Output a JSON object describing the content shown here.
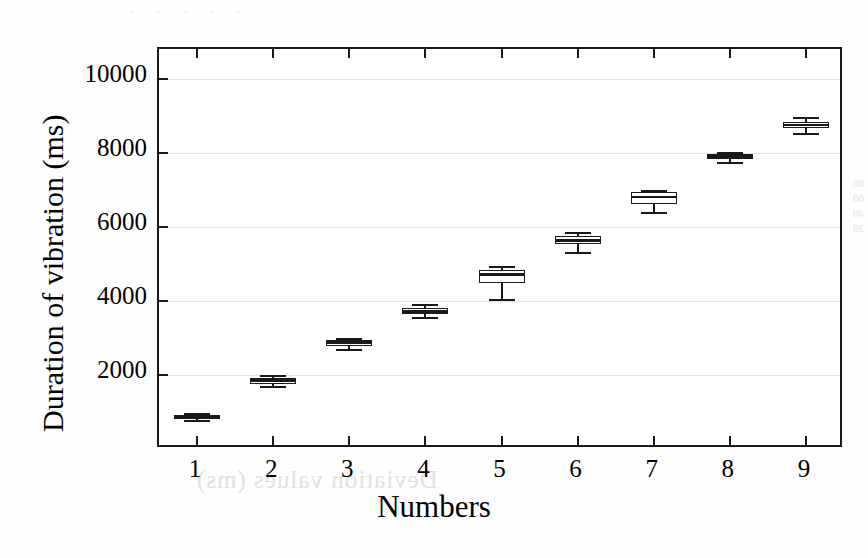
{
  "figure": {
    "background_color": "#ffffff",
    "axis_color": "#1a1a1a",
    "grid_color": "#e2e2e2",
    "box_fill": "#ffffff",
    "bleed_text_bottom": "Deviation values (ms)",
    "bleed_text_right": "80\n60\n40\n20",
    "bleed_text_top": "- - - - -"
  },
  "chart_data": {
    "type": "box",
    "title": "",
    "xlabel": "Numbers",
    "ylabel": "Duration of vibration (ms)",
    "grid": true,
    "legend": "none",
    "xlim": [
      0.5,
      9.5
    ],
    "ylim": [
      0,
      10800
    ],
    "categories": [
      "1",
      "2",
      "3",
      "4",
      "5",
      "6",
      "7",
      "8",
      "9"
    ],
    "ytick_labels": [
      "2000",
      "4000",
      "6000",
      "8000",
      "10000"
    ],
    "ytick_values": [
      2000,
      4000,
      6000,
      8000,
      10000
    ],
    "boxes": [
      {
        "category": "1",
        "whisker_low": 780,
        "q1": 820,
        "median": 880,
        "q3": 920,
        "whisker_high": 960
      },
      {
        "category": "2",
        "whisker_low": 1690,
        "q1": 1760,
        "median": 1850,
        "q3": 1930,
        "whisker_high": 1990
      },
      {
        "category": "3",
        "whisker_low": 2700,
        "q1": 2780,
        "median": 2880,
        "q3": 2930,
        "whisker_high": 2990
      },
      {
        "category": "4",
        "whisker_low": 3560,
        "q1": 3640,
        "median": 3720,
        "q3": 3800,
        "whisker_high": 3920
      },
      {
        "category": "5",
        "whisker_low": 4060,
        "q1": 4480,
        "median": 4720,
        "q3": 4830,
        "whisker_high": 4950
      },
      {
        "category": "6",
        "whisker_low": 5330,
        "q1": 5540,
        "median": 5630,
        "q3": 5740,
        "whisker_high": 5850
      },
      {
        "category": "7",
        "whisker_low": 6400,
        "q1": 6620,
        "median": 6810,
        "q3": 6930,
        "whisker_high": 7000
      },
      {
        "category": "8",
        "whisker_low": 7750,
        "q1": 7830,
        "median": 7910,
        "q3": 7960,
        "whisker_high": 8030
      },
      {
        "category": "9",
        "whisker_low": 8520,
        "q1": 8670,
        "median": 8760,
        "q3": 8830,
        "whisker_high": 8960
      }
    ]
  }
}
